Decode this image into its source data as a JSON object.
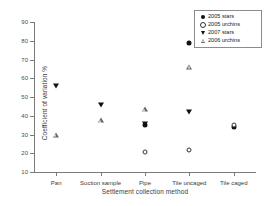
{
  "chart_data": {
    "type": "scatter",
    "title": "",
    "xlabel": "Settlement collection method",
    "ylabel": "Coefficient of variation %",
    "categories": [
      "Pan",
      "Suction sample",
      "Pipe",
      "Tile uncaged",
      "Tile caged"
    ],
    "ylim": [
      10,
      90
    ],
    "ytick_labels": [
      "10",
      "20",
      "30",
      "40",
      "50",
      "60",
      "70",
      "80",
      "90"
    ],
    "yticks": [
      10,
      20,
      30,
      40,
      50,
      60,
      70,
      80,
      90
    ],
    "grid": false,
    "legend_position": "top-right",
    "series": [
      {
        "name": "2005 stars",
        "marker": "filled-circle",
        "values": [
          null,
          null,
          35.0,
          79.0,
          34.0
        ]
      },
      {
        "name": "2005 urchins",
        "marker": "open-circle",
        "values": [
          null,
          null,
          20.5,
          21.5,
          35.0
        ]
      },
      {
        "name": "2007 stars",
        "marker": "filled-triangle-down",
        "values": [
          56.0,
          46.0,
          35.5,
          42.0,
          null
        ]
      },
      {
        "name": "2006 urchins",
        "marker": "open-triangle-up",
        "values": [
          30.0,
          37.5,
          43.5,
          66.0,
          null
        ]
      }
    ]
  },
  "legend": {
    "entries": [
      {
        "label": "2005 stars",
        "marker": "filled-circle"
      },
      {
        "label": "2005 urchins",
        "marker": "open-circle"
      },
      {
        "label": "2007 stars",
        "marker": "filled-triangle-down"
      },
      {
        "label": "2006 urchins",
        "marker": "open-triangle-up"
      }
    ]
  }
}
